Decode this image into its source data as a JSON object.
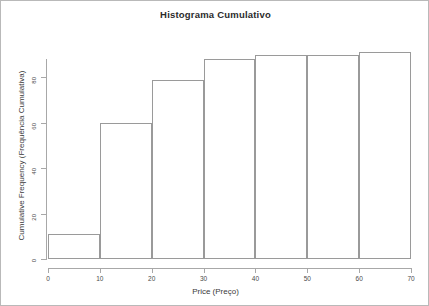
{
  "chart_data": {
    "type": "bar",
    "title": "Histograma Cumulativo",
    "xlabel": "Price (Preço)",
    "ylabel": "Cumulative Frequency (Frequência Cumulativa)",
    "categories": [
      "0-10",
      "10-20",
      "20-30",
      "30-40",
      "40-50",
      "50-60",
      "60-70"
    ],
    "bin_edges": [
      0,
      10,
      20,
      30,
      40,
      50,
      60,
      70
    ],
    "values": [
      11,
      60,
      79,
      88,
      90,
      90,
      91
    ],
    "xlim": [
      0,
      70
    ],
    "ylim": [
      0,
      96
    ],
    "xticks": [
      0,
      10,
      20,
      30,
      40,
      50,
      60,
      70
    ],
    "yticks": [
      0,
      20,
      40,
      60,
      80
    ],
    "xtick_labels": [
      "0",
      "10",
      "20",
      "30",
      "40",
      "50",
      "60",
      "70"
    ],
    "ytick_labels": [
      "0",
      "20",
      "40",
      "60",
      "80"
    ],
    "grid": false,
    "legend": null,
    "bar_border_color": "#9a9a9a",
    "bar_fill_color": "transparent",
    "axis_color": "#a8a8a8",
    "text_color": "#3a3a3a",
    "frame_color": "#b9b9b9"
  }
}
